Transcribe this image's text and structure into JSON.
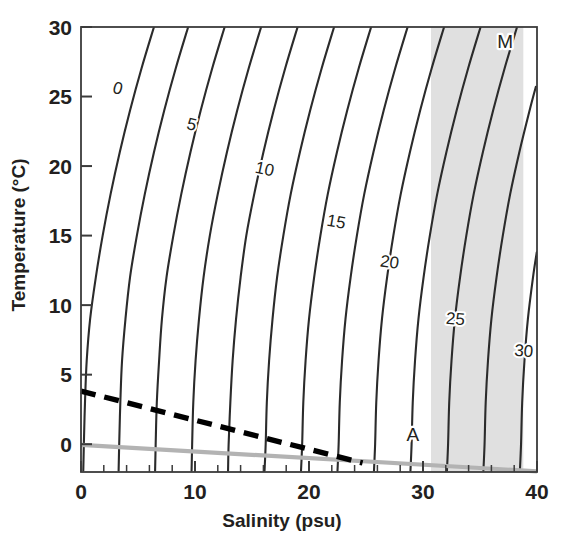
{
  "figure": {
    "kind": "temperature-salinity-density-diagram",
    "background_color": "#ffffff",
    "frame_color": "#3b3b3b",
    "contour_color": "#2b2b2b",
    "shade_color": "#e0e0e0",
    "freezing_line_color": "#b3b3b3",
    "dashed_line_color": "#000000"
  },
  "chart_data": {
    "type": "line",
    "title": "",
    "subtitle": "",
    "xlabel": "Salinity (psu)",
    "ylabel": "Temperature (°C)",
    "xlim": [
      0,
      40
    ],
    "ylim": [
      -2,
      30
    ],
    "grid": false,
    "legend_position": "none",
    "x_ticks_major": [
      0,
      10,
      20,
      30,
      40
    ],
    "x_ticks_major_labels": [
      "0",
      "10",
      "20",
      "30",
      "40"
    ],
    "x_ticks_minor_step": 2,
    "y_ticks_major": [
      0,
      5,
      10,
      15,
      20,
      25,
      30
    ],
    "y_ticks_major_labels": [
      "0",
      "5",
      "10",
      "15",
      "20",
      "25",
      "30"
    ],
    "series": [
      {
        "name": "sigma-t 0",
        "label": "0",
        "label_point": [
          3.1,
          25.2
        ],
        "points": [
          [
            0.2,
            -1.9
          ],
          [
            0.25,
            0
          ],
          [
            0.35,
            3
          ],
          [
            0.5,
            6
          ],
          [
            0.8,
            9
          ],
          [
            1.3,
            12
          ],
          [
            1.9,
            15
          ],
          [
            2.6,
            18
          ],
          [
            3.4,
            21
          ],
          [
            4.3,
            24
          ],
          [
            5.3,
            27
          ],
          [
            6.4,
            30
          ]
        ]
      },
      {
        "name": "sigma-t 2.5",
        "label": "",
        "label_point": null,
        "points": [
          [
            3.3,
            -1.9
          ],
          [
            3.35,
            0
          ],
          [
            3.45,
            3
          ],
          [
            3.6,
            6
          ],
          [
            3.9,
            9
          ],
          [
            4.3,
            12
          ],
          [
            4.9,
            15
          ],
          [
            5.6,
            18
          ],
          [
            6.4,
            21
          ],
          [
            7.3,
            24
          ],
          [
            8.3,
            27
          ],
          [
            9.4,
            30
          ]
        ]
      },
      {
        "name": "sigma-t 5",
        "label": "5",
        "label_point": [
          9.6,
          22.6
        ],
        "points": [
          [
            6.5,
            -1.9
          ],
          [
            6.55,
            0
          ],
          [
            6.65,
            3
          ],
          [
            6.85,
            6
          ],
          [
            7.1,
            9
          ],
          [
            7.5,
            12
          ],
          [
            8.1,
            15
          ],
          [
            8.8,
            18
          ],
          [
            9.6,
            21
          ],
          [
            10.5,
            24
          ],
          [
            11.5,
            27
          ],
          [
            12.6,
            30
          ]
        ]
      },
      {
        "name": "sigma-t 7.5",
        "label": "",
        "label_point": null,
        "points": [
          [
            9.7,
            -1.9
          ],
          [
            9.75,
            0
          ],
          [
            9.85,
            3
          ],
          [
            10.05,
            6
          ],
          [
            10.35,
            9
          ],
          [
            10.75,
            12
          ],
          [
            11.3,
            15
          ],
          [
            12.0,
            18
          ],
          [
            12.8,
            21
          ],
          [
            13.7,
            24
          ],
          [
            14.7,
            27
          ],
          [
            15.8,
            30
          ]
        ]
      },
      {
        "name": "sigma-t 10",
        "label": "10",
        "label_point": [
          16.0,
          19.4
        ],
        "points": [
          [
            12.9,
            -1.9
          ],
          [
            12.95,
            0
          ],
          [
            13.1,
            3
          ],
          [
            13.3,
            6
          ],
          [
            13.6,
            9
          ],
          [
            14.0,
            12
          ],
          [
            14.5,
            15
          ],
          [
            15.2,
            18
          ],
          [
            16.0,
            21
          ],
          [
            16.9,
            24
          ],
          [
            17.9,
            27
          ],
          [
            19.0,
            30
          ]
        ]
      },
      {
        "name": "sigma-t 12.5",
        "label": "",
        "label_point": null,
        "points": [
          [
            16.1,
            -1.9
          ],
          [
            16.2,
            0
          ],
          [
            16.3,
            3
          ],
          [
            16.5,
            6
          ],
          [
            16.8,
            9
          ],
          [
            17.2,
            12
          ],
          [
            17.75,
            15
          ],
          [
            18.4,
            18
          ],
          [
            19.2,
            21
          ],
          [
            20.1,
            24
          ],
          [
            21.1,
            27
          ],
          [
            22.2,
            30
          ]
        ]
      },
      {
        "name": "sigma-t 15",
        "label": "15",
        "label_point": [
          22.3,
          15.6
        ],
        "points": [
          [
            19.3,
            -1.9
          ],
          [
            19.4,
            0
          ],
          [
            19.5,
            3
          ],
          [
            19.7,
            6
          ],
          [
            20.0,
            9
          ],
          [
            20.45,
            12
          ],
          [
            21.0,
            15
          ],
          [
            21.65,
            18
          ],
          [
            22.45,
            21
          ],
          [
            23.35,
            24
          ],
          [
            24.35,
            27
          ],
          [
            25.45,
            30
          ]
        ]
      },
      {
        "name": "sigma-t 17.5",
        "label": "",
        "label_point": null,
        "points": [
          [
            22.5,
            -1.9
          ],
          [
            22.6,
            0
          ],
          [
            22.7,
            3
          ],
          [
            22.9,
            6
          ],
          [
            23.2,
            9
          ],
          [
            23.65,
            12
          ],
          [
            24.2,
            15
          ],
          [
            24.85,
            18
          ],
          [
            25.65,
            21
          ],
          [
            26.55,
            24
          ],
          [
            27.55,
            27
          ],
          [
            28.65,
            30
          ]
        ]
      },
      {
        "name": "sigma-t 20",
        "label": "20",
        "label_point": [
          27.0,
          12.7
        ],
        "points": [
          [
            25.7,
            -1.9
          ],
          [
            25.8,
            0
          ],
          [
            25.9,
            3
          ],
          [
            26.1,
            6
          ],
          [
            26.4,
            9
          ],
          [
            26.85,
            12
          ],
          [
            27.4,
            15
          ],
          [
            28.05,
            18
          ],
          [
            28.85,
            21
          ],
          [
            29.75,
            24
          ],
          [
            30.75,
            27
          ],
          [
            31.85,
            30
          ]
        ]
      },
      {
        "name": "sigma-t 22.5",
        "label": "",
        "label_point": null,
        "points": [
          [
            28.9,
            -1.9
          ],
          [
            29.0,
            0
          ],
          [
            29.1,
            3
          ],
          [
            29.3,
            6
          ],
          [
            29.6,
            9
          ],
          [
            30.05,
            12
          ],
          [
            30.6,
            15
          ],
          [
            31.25,
            18
          ],
          [
            32.05,
            21
          ],
          [
            32.95,
            24
          ],
          [
            33.95,
            27
          ],
          [
            35.05,
            30
          ]
        ]
      },
      {
        "name": "sigma-t 25",
        "label": "25",
        "label_point": [
          32.8,
          8.6
        ],
        "points": [
          [
            32.1,
            -1.9
          ],
          [
            32.2,
            0
          ],
          [
            32.3,
            3
          ],
          [
            32.5,
            6
          ],
          [
            32.8,
            9
          ],
          [
            33.25,
            12
          ],
          [
            33.8,
            15
          ],
          [
            34.45,
            18
          ],
          [
            35.25,
            21
          ],
          [
            36.15,
            24
          ],
          [
            37.15,
            27
          ],
          [
            38.25,
            30
          ]
        ]
      },
      {
        "name": "sigma-t 27.5",
        "label": "",
        "label_point": null,
        "points": [
          [
            35.3,
            -1.9
          ],
          [
            35.4,
            0
          ],
          [
            35.5,
            3
          ],
          [
            35.7,
            6
          ],
          [
            36.0,
            9
          ],
          [
            36.45,
            12
          ],
          [
            37.0,
            15
          ],
          [
            37.65,
            18
          ],
          [
            38.45,
            21
          ],
          [
            39.35,
            24
          ],
          [
            39.9,
            25.7
          ]
        ]
      },
      {
        "name": "sigma-t 30",
        "label": "30",
        "label_point": [
          38.8,
          6.3
        ],
        "points": [
          [
            38.5,
            -1.9
          ],
          [
            38.6,
            0
          ],
          [
            38.7,
            3
          ],
          [
            38.9,
            6
          ],
          [
            39.2,
            9
          ],
          [
            39.65,
            12
          ],
          [
            39.98,
            13.8
          ]
        ]
      }
    ],
    "shaded_band": {
      "name": "seawater-salinity-band",
      "x_start": 30.7,
      "x_end": 38.8,
      "color": "#e0e0e0"
    },
    "freezing_line": {
      "name": "freezing-point-line",
      "style": "solid",
      "color": "#b3b3b3",
      "points": [
        [
          0,
          -0.05
        ],
        [
          40,
          -1.95
        ]
      ]
    },
    "max_density_line": {
      "name": "temperature-of-maximum-density-line",
      "style": "dashed",
      "color": "#000000",
      "points": [
        [
          0,
          3.82
        ],
        [
          24.7,
          -1.35
        ]
      ]
    },
    "annotations": [
      {
        "name": "label-M",
        "text": "M",
        "x": 37.2,
        "y": 28.5
      },
      {
        "name": "label-A",
        "text": "A",
        "x": 29.1,
        "y": 0.25
      }
    ]
  }
}
